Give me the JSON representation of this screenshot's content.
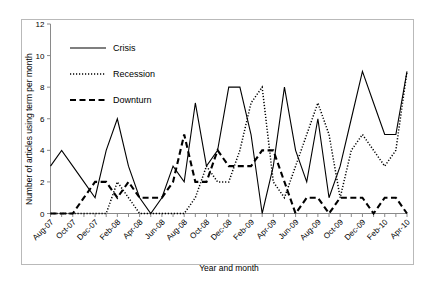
{
  "chart_data": {
    "type": "line",
    "title": "",
    "xlabel": "Year and month",
    "ylabel": "Number of articles using term per month",
    "ylim": [
      0,
      12
    ],
    "yticks": [
      0,
      2,
      4,
      6,
      8,
      10,
      12
    ],
    "grid": false,
    "legend_position": "top-left-inside",
    "x": [
      "Aug-07",
      "Sep-07",
      "Oct-07",
      "Nov-07",
      "Dec-07",
      "Jan-08",
      "Feb-08",
      "Mar-08",
      "Apr-08",
      "May-08",
      "Jun-08",
      "Jul-08",
      "Aug-08",
      "Sep-08",
      "Oct-08",
      "Nov-08",
      "Dec-08",
      "Jan-09",
      "Feb-09",
      "Mar-09",
      "Apr-09",
      "May-09",
      "Jun-09",
      "Jul-09",
      "Aug-09",
      "Sep-09",
      "Oct-09",
      "Nov-09",
      "Dec-09",
      "Jan-10",
      "Feb-10",
      "Mar-10",
      "Apr-10"
    ],
    "xtick_labels": [
      "Aug-07",
      "Oct-07",
      "Dec-07",
      "Feb-08",
      "Apr-08",
      "Jun-08",
      "Aug-08",
      "Oct-08",
      "Dec-08",
      "Feb-09",
      "Apr-09",
      "Jun-09",
      "Aug-09",
      "Oct-09",
      "Dec-09",
      "Feb-10",
      "Apr-10"
    ],
    "xtick_indices": [
      0,
      2,
      4,
      6,
      8,
      10,
      12,
      14,
      16,
      18,
      20,
      22,
      24,
      26,
      28,
      30,
      32
    ],
    "series": [
      {
        "name": "Crisis",
        "style": "solid",
        "values": [
          3,
          4,
          3,
          2,
          1,
          4,
          6,
          3,
          1,
          0,
          1,
          3,
          2,
          7,
          3,
          4,
          8,
          8,
          5,
          0,
          3,
          8,
          4,
          2,
          6,
          1,
          3,
          6,
          9,
          7,
          5,
          5,
          9
        ]
      },
      {
        "name": "Recession",
        "style": "dotted",
        "values": [
          0,
          0,
          0,
          0,
          0,
          0,
          2,
          1,
          0,
          0,
          0,
          0,
          0,
          1,
          3,
          2,
          2,
          4,
          7,
          8,
          2,
          1,
          3,
          5,
          7,
          5,
          1,
          4,
          5,
          4,
          3,
          4,
          9
        ]
      },
      {
        "name": "Downturn",
        "style": "dashed",
        "values": [
          0,
          0,
          0,
          1,
          2,
          2,
          1,
          2,
          1,
          1,
          1,
          2,
          5,
          2,
          2,
          4,
          3,
          3,
          3,
          4,
          4,
          2,
          0,
          1,
          1,
          0,
          1,
          1,
          1,
          0,
          1,
          1,
          0
        ]
      }
    ]
  },
  "legend": {
    "items": [
      {
        "label": "Crisis",
        "style": "solid"
      },
      {
        "label": "Recession",
        "style": "dotted"
      },
      {
        "label": "Downturn",
        "style": "dashed"
      }
    ]
  },
  "colors": {
    "series": "#000000",
    "axis": "#8a8a8a",
    "frame": "#b9b9b9",
    "background": "#ffffff"
  }
}
